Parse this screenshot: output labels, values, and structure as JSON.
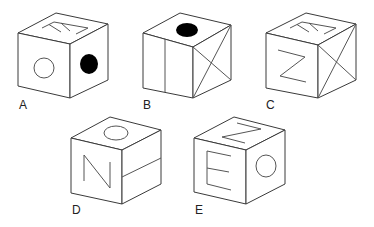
{
  "figure": {
    "type": "cube-folding-options",
    "stroke_color": "#3a3a3a",
    "fill_color": "#ffffff",
    "filled_dot_color": "#000000"
  },
  "options": [
    {
      "label": "A",
      "faces": {
        "top": "E (rotated)",
        "front": "open circle",
        "right": "filled black circle"
      }
    },
    {
      "label": "B",
      "faces": {
        "top": "filled black circle",
        "front": "vertical line",
        "right": "X (diagonal cross)"
      }
    },
    {
      "label": "C",
      "faces": {
        "top": "E (rotated)",
        "front": "Z",
        "right": "X (diagonal cross)"
      }
    },
    {
      "label": "D",
      "faces": {
        "top": "open circle",
        "front": "N",
        "right": "horizontal line"
      }
    },
    {
      "label": "E",
      "faces": {
        "top": "Z (rotated)",
        "front": "E",
        "right": "open circle"
      }
    }
  ]
}
